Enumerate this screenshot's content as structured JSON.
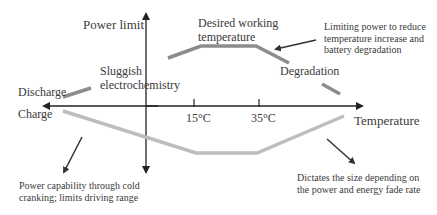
{
  "diagram": {
    "axes": {
      "y_label": "Power limit",
      "x_label": "Temperature",
      "upper_side_label": "Discharge",
      "lower_side_label": "Charge",
      "ticks": [
        "15°C",
        "35°C"
      ]
    },
    "regions": {
      "cold": "Sluggish electrochemistry",
      "optimal_line1": "Desired working",
      "optimal_line2": "temperature",
      "hot": "Degradation"
    },
    "annotations": {
      "top_right_line1": "Limiting power to reduce",
      "top_right_line2": "temperature increase and",
      "top_right_line3": "battery degradation",
      "bottom_left_line1": "Power capability through cold",
      "bottom_left_line2": "cranking; limits driving range",
      "bottom_right_line1": "Dictates the size depending on",
      "bottom_right_line2": "the power and energy fade rate"
    },
    "colors": {
      "axis": "#222222",
      "discharge_curve": "#8c8c8c",
      "charge_curve": "#bdbdbd"
    }
  }
}
